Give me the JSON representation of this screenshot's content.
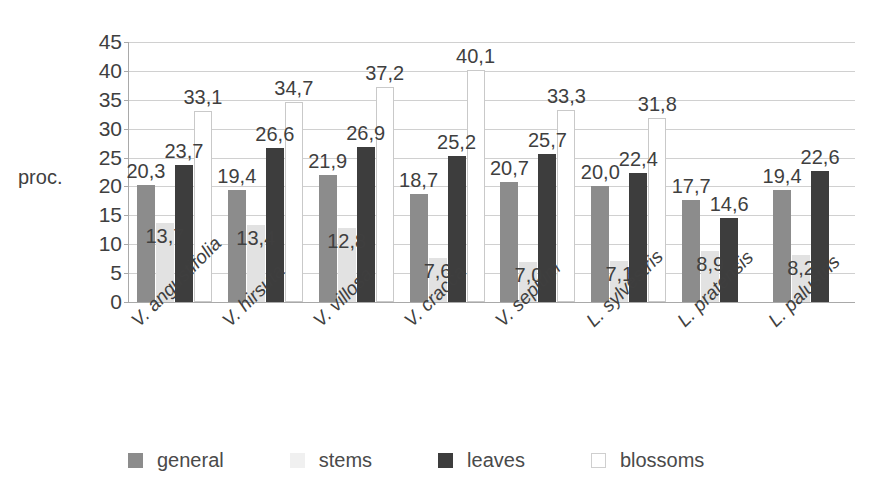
{
  "chart_data": {
    "type": "bar",
    "title": "",
    "subtitle": "",
    "xlabel": "",
    "ylabel": "proc.",
    "ylim": [
      0,
      45
    ],
    "ytick_step": 5,
    "yticks": [
      "45",
      "40",
      "35",
      "30",
      "25",
      "20",
      "15",
      "10",
      "5",
      "0"
    ],
    "grid": true,
    "legend_position": "bottom",
    "decimal_separator": ",",
    "categories": [
      "V. angustifolia",
      "V. hirsuta",
      "V. villosa",
      "V. cracca",
      "V. sepium",
      "L. sylvestris",
      "L. pratensis",
      "L. palustris"
    ],
    "series": [
      {
        "name": "general",
        "color": "#8c8c8c",
        "values": [
          20.3,
          19.4,
          21.9,
          18.7,
          20.7,
          20.0,
          17.7,
          19.4
        ],
        "labels": [
          "20,3",
          "19,4",
          "21,9",
          "18,7",
          "20,7",
          "20,0",
          "17,7",
          "19,4"
        ]
      },
      {
        "name": "stems",
        "color": "#e2e2e2",
        "values": [
          13.7,
          13.4,
          12.8,
          7.6,
          7.0,
          7.1,
          8.9,
          8.2
        ],
        "labels": [
          "13,7",
          "13,4",
          "12,8",
          "7,6",
          "7,0",
          "7,1",
          "8,9",
          "8,2"
        ]
      },
      {
        "name": "leaves",
        "color": "#3d3d3d",
        "values": [
          23.7,
          26.6,
          26.9,
          25.2,
          25.7,
          22.4,
          14.6,
          22.6
        ],
        "labels": [
          "23,7",
          "26,6",
          "26,9",
          "25,2",
          "25,7",
          "22,4",
          "14,6",
          "22,6"
        ]
      },
      {
        "name": "blossoms",
        "color": "#ffffff",
        "values": [
          33.1,
          34.7,
          37.2,
          40.1,
          33.3,
          31.8,
          null,
          null
        ],
        "labels": [
          "33,1",
          "34,7",
          "37,2",
          "40,1",
          "33,3",
          "31,8",
          "",
          ""
        ]
      }
    ],
    "blossom_label_positions": [
      {
        "category_index": 0,
        "label": "33,1"
      },
      {
        "category_index": 2,
        "label": "34,7"
      },
      {
        "category_index": 3,
        "label": "37,2"
      },
      {
        "category_index": 4,
        "label": "40,1"
      },
      {
        "category_index": 5,
        "label": "33,3"
      },
      {
        "category_index": 6,
        "label": "31,8"
      }
    ]
  },
  "legend": {
    "items": [
      {
        "label": "general"
      },
      {
        "label": "stems"
      },
      {
        "label": "leaves"
      },
      {
        "label": "blossoms"
      }
    ]
  }
}
